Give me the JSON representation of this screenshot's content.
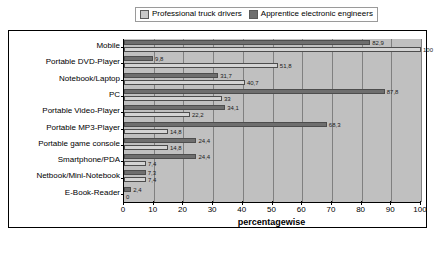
{
  "legend": {
    "position": "top-center",
    "entries": [
      {
        "label": "Professional truck drivers",
        "swatch": "light",
        "color": "#c8c8c8"
      },
      {
        "label": "Apprentice electronic engineers",
        "swatch": "dark",
        "color": "#6e6e6e"
      }
    ]
  },
  "chart_data": {
    "type": "bar",
    "orientation": "horizontal",
    "title": "",
    "subtitle": "",
    "xlabel": "percentagewise",
    "ylabel": "",
    "xlim": [
      0,
      100
    ],
    "xticks": [
      0,
      10,
      20,
      30,
      40,
      50,
      60,
      70,
      80,
      90,
      100
    ],
    "xtick_labels": [
      "0",
      "10",
      "20",
      "30",
      "40",
      "50",
      "60",
      "70",
      "80",
      "90",
      "100"
    ],
    "grid": "vertical",
    "legend_position": "top-center",
    "categories": [
      "Mobile",
      "Portable DVD-Player",
      "Notebook/Laptop",
      "PC",
      "Portable Video-Player",
      "Portable MP3-Player",
      "Portable game console",
      "Smartphone/PDA",
      "Netbook/Mini-Notebook",
      "E-Book-Reader"
    ],
    "series": [
      {
        "name": "Apprentice electronic engineers",
        "color": "#6e6e6e",
        "values": [
          82.9,
          9.8,
          31.7,
          87.8,
          34.1,
          68.3,
          24.4,
          24.4,
          7.3,
          2.4
        ],
        "labels": [
          "82,9",
          "9,8",
          "31,7",
          "87,8",
          "34,1",
          "68,3",
          "24,4",
          "24,4",
          "7,3",
          "2,4"
        ]
      },
      {
        "name": "Professional truck drivers",
        "color": "#d4d4d4",
        "values": [
          100,
          51.8,
          40.7,
          33,
          22.2,
          14.8,
          14.8,
          7.4,
          7.4,
          0
        ],
        "labels": [
          "100",
          "51,8",
          "40,7",
          "33",
          "22,2",
          "14,8",
          "14,8",
          "7,4",
          "7,4",
          "0"
        ]
      }
    ]
  }
}
